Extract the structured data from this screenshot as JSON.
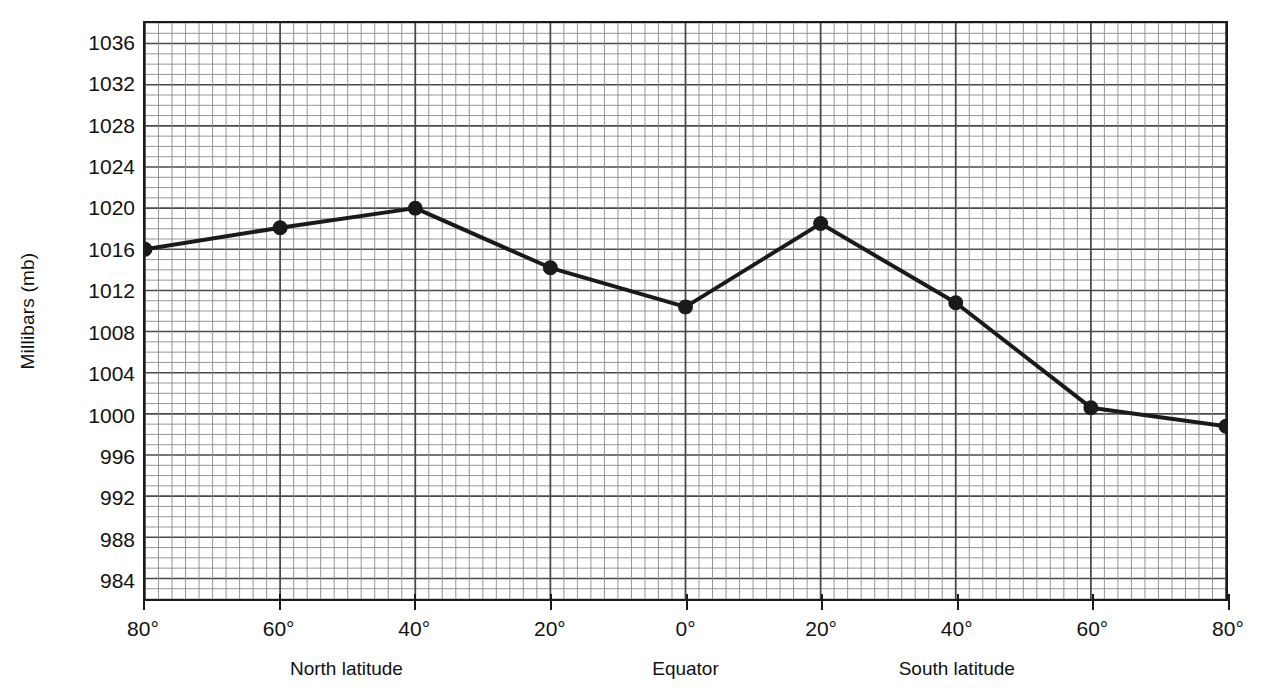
{
  "chart_data": {
    "type": "line",
    "title": "",
    "xlabel": "Latitude",
    "ylabel": "Millibars (mb)",
    "ylim": [
      982,
      1038
    ],
    "xlim": [
      -80,
      80
    ],
    "grid": true,
    "legend": "none",
    "x_labels": [
      "80°",
      "60°",
      "40°",
      "20°",
      "0°",
      "20°",
      "40°",
      "60°",
      "80°"
    ],
    "x": [
      -80,
      -60,
      -40,
      -20,
      0,
      20,
      40,
      60,
      80
    ],
    "categories": [
      "80°N",
      "60°N",
      "40°N",
      "20°N",
      "0° Equator",
      "20°S",
      "40°S",
      "60°S",
      "80°S"
    ],
    "values": [
      1016.0,
      1018.1,
      1020.0,
      1014.2,
      1010.4,
      1018.5,
      1010.8,
      1000.6,
      998.8
    ],
    "series": [
      {
        "name": "Mean sea-level air pressure",
        "values": [
          1016.0,
          1018.1,
          1020.0,
          1014.2,
          1010.4,
          1018.5,
          1010.8,
          1000.6,
          998.8
        ]
      }
    ],
    "y_ticks": [
      1036,
      1032,
      1028,
      1024,
      1020,
      1016,
      1012,
      1008,
      1004,
      1000,
      996,
      992,
      988,
      984
    ],
    "y_tick_step": 4,
    "y_minor_step": 1,
    "x_minor_step": 2,
    "marker": "filled-circle",
    "line_color": "#1a1a1a",
    "grid_color": "#8a8a8a",
    "grid_major_color": "#4a4a4a",
    "axis_color": "#1a1a1a",
    "background": "#ffffff"
  },
  "axes": {
    "y_title": "Millibars (mb)",
    "x_groups": [
      {
        "label": "North latitude",
        "center_x": -50
      },
      {
        "label": "Equator",
        "center_x": 0
      },
      {
        "label": "South latitude",
        "center_x": 40
      }
    ]
  }
}
